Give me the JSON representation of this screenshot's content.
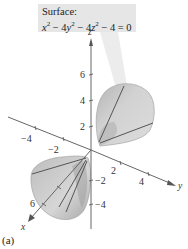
{
  "callout": {
    "title": "Surface:",
    "equation_text": "x^2 - 4y^2 - 4z^2 - 4 = 0",
    "equation_parts": {
      "t1": "x",
      "e1": "2",
      "op1": " − 4",
      "t2": "y",
      "e2": "2",
      "op2": " − 4",
      "t3": "z",
      "e3": "2",
      "rest": " − 4 = 0"
    }
  },
  "axes": {
    "x": {
      "name": "x",
      "tick_labels": [
        "6"
      ]
    },
    "y": {
      "name": "y",
      "tick_labels": [
        "−4",
        "−2",
        "2",
        "4"
      ]
    },
    "z": {
      "name": "z",
      "tick_labels": [
        "6",
        "4",
        "2",
        "−2",
        "−4"
      ]
    }
  },
  "surface": {
    "type": "hyperboloid of two sheets",
    "fill_color": "#c8c8c8",
    "shade_color": "#a9a9a9",
    "trace_line_color": "#555555"
  },
  "caption": "(a)"
}
